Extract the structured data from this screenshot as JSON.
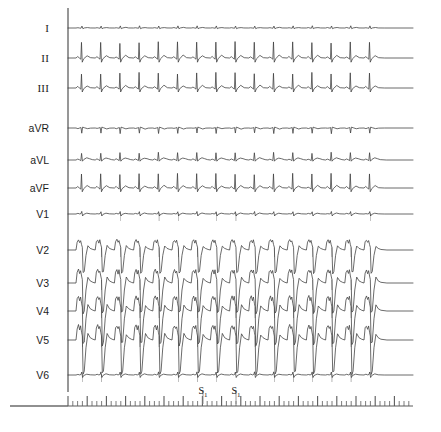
{
  "page": {
    "background_color": "#ffffff",
    "width": 441,
    "height": 432
  },
  "colors": {
    "trace": "#3a3a3a",
    "axis": "#6b6b6b",
    "ruler_tick": "#5a5a5a",
    "label_text": "#1d1d1d",
    "annotation_text": "#141414"
  },
  "axis": {
    "vertical_line_x": 68,
    "vertical_line_top": 8,
    "vertical_line_bottom": 392,
    "baseline_y": 406,
    "baseline_left": 10,
    "baseline_right": 68
  },
  "leads": [
    {
      "label": "I",
      "style": "roman",
      "baseline_y": 28,
      "gain": 0.38,
      "morphology": "limb-small"
    },
    {
      "label": "II",
      "style": "roman",
      "baseline_y": 58,
      "gain": 1.0,
      "morphology": "limb-tall-r"
    },
    {
      "label": "III",
      "style": "roman",
      "baseline_y": 88,
      "gain": 0.95,
      "morphology": "limb-tall-r"
    },
    {
      "label": "aVR",
      "style": "sans",
      "baseline_y": 128,
      "gain": 0.55,
      "morphology": "avr-negative"
    },
    {
      "label": "aVL",
      "style": "sans",
      "baseline_y": 160,
      "gain": 0.6,
      "morphology": "limb-notched"
    },
    {
      "label": "aVF",
      "style": "sans",
      "baseline_y": 188,
      "gain": 0.9,
      "morphology": "limb-tall-r"
    },
    {
      "label": "V1",
      "style": "sans",
      "baseline_y": 214,
      "gain": 0.4,
      "morphology": "precordial-small"
    },
    {
      "label": "V2",
      "style": "sans",
      "baseline_y": 250,
      "gain": 1.35,
      "morphology": "precordial-deep-s"
    },
    {
      "label": "V3",
      "style": "sans",
      "baseline_y": 283,
      "gain": 1.75,
      "morphology": "precordial-deep-s"
    },
    {
      "label": "V4",
      "style": "sans",
      "baseline_y": 311,
      "gain": 1.95,
      "morphology": "precordial-deep-s"
    },
    {
      "label": "V5",
      "style": "sans",
      "baseline_y": 340,
      "gain": 1.95,
      "morphology": "precordial-deep-s"
    },
    {
      "label": "V6",
      "style": "sans",
      "baseline_y": 375,
      "gain": 0.5,
      "morphology": "precordial-small"
    }
  ],
  "trace_area": {
    "x_start": 68,
    "x_end": 413,
    "beats": 18,
    "beat_spacing": 19.2,
    "first_beat_x": 76
  },
  "annotations": [
    {
      "label": "S",
      "subscript": "1",
      "x": 203,
      "y": 386,
      "tick_top": 390,
      "tick_bottom": 404
    },
    {
      "label": "S",
      "subscript": "1",
      "x": 236,
      "y": 386,
      "tick_top": 390,
      "tick_bottom": 404
    }
  ],
  "ruler": {
    "y_base": 406,
    "x_start": 68,
    "x_end": 413,
    "minor_spacing": 4.8,
    "minor_height": 5,
    "major_every": 4,
    "major_height": 10
  },
  "chart_data": {
    "type": "line",
    "title": "",
    "xlabel": "",
    "ylabel": "",
    "series": [
      {
        "name": "I",
        "amplitude_rel": 0.38
      },
      {
        "name": "II",
        "amplitude_rel": 1.0
      },
      {
        "name": "III",
        "amplitude_rel": 0.95
      },
      {
        "name": "aVR",
        "amplitude_rel": 0.55
      },
      {
        "name": "aVL",
        "amplitude_rel": 0.6
      },
      {
        "name": "aVF",
        "amplitude_rel": 0.9
      },
      {
        "name": "V1",
        "amplitude_rel": 0.4
      },
      {
        "name": "V2",
        "amplitude_rel": 1.35
      },
      {
        "name": "V3",
        "amplitude_rel": 1.75
      },
      {
        "name": "V4",
        "amplitude_rel": 1.95
      },
      {
        "name": "V5",
        "amplitude_rel": 1.95
      },
      {
        "name": "V6",
        "amplitude_rel": 0.5
      }
    ],
    "categories": [
      "I",
      "II",
      "III",
      "aVR",
      "aVL",
      "aVF",
      "V1",
      "V2",
      "V3",
      "V4",
      "V5",
      "V6"
    ],
    "annotations": [
      "S1",
      "S1"
    ],
    "grid": false,
    "legend": "none"
  }
}
